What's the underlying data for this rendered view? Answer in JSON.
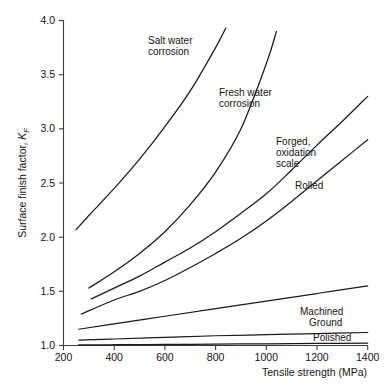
{
  "chart_data": {
    "type": "line",
    "title": "",
    "xlabel": "Tensile strength (MPa)",
    "ylabel": "Surface finish factor, K_F",
    "ylabel_main": "Surface finish factor, ",
    "ylabel_symbol": "K",
    "ylabel_subscript": "F",
    "xlim": [
      200,
      1400
    ],
    "ylim": [
      1.0,
      4.0
    ],
    "grid": false,
    "legend_position": "inline-annotations",
    "xticks": [
      200,
      400,
      600,
      800,
      1000,
      1200,
      1400
    ],
    "xtick_labels": [
      "200",
      "400",
      "600",
      "800",
      "1000",
      "1200",
      "1400"
    ],
    "yticks": [
      1.0,
      1.5,
      2.0,
      2.5,
      3.0,
      3.5,
      4.0
    ],
    "ytick_labels": [
      "1.0",
      "1.5",
      "2.0",
      "2.5",
      "3.0",
      "3.5",
      "4.0"
    ],
    "series": [
      {
        "name": "Salt water corrosion",
        "label": "Salt water\ncorrosion",
        "label_line1": "Salt water",
        "label_line2": "corrosion",
        "x": [
          250,
          300,
          400,
          500,
          600,
          700,
          800,
          840
        ],
        "values": [
          2.07,
          2.2,
          2.45,
          2.72,
          3.02,
          3.35,
          3.75,
          3.93
        ]
      },
      {
        "name": "Fresh water corrosion",
        "label": "Fresh water\ncorrosion",
        "label_line1": "Fresh water",
        "label_line2": "corrosion",
        "x": [
          300,
          400,
          500,
          600,
          700,
          800,
          900,
          1000,
          1040
        ],
        "values": [
          1.53,
          1.68,
          1.85,
          2.05,
          2.3,
          2.6,
          3.0,
          3.6,
          3.9
        ]
      },
      {
        "name": "Forged, oxidation scale",
        "label": "Forged,\noxidation\nscale",
        "label_line1": "Forged,",
        "label_line2": "oxidation",
        "label_line3": "scale",
        "x": [
          310,
          400,
          500,
          600,
          700,
          800,
          900,
          1000,
          1100,
          1200,
          1300,
          1400
        ],
        "values": [
          1.43,
          1.53,
          1.64,
          1.77,
          1.9,
          2.05,
          2.22,
          2.4,
          2.62,
          2.85,
          3.07,
          3.3
        ]
      },
      {
        "name": "Rolled",
        "label": "Rolled",
        "label_line1": "Rolled",
        "x": [
          270,
          400,
          500,
          600,
          700,
          800,
          900,
          1000,
          1100,
          1200,
          1300,
          1400
        ],
        "values": [
          1.29,
          1.42,
          1.5,
          1.6,
          1.72,
          1.85,
          1.99,
          2.15,
          2.33,
          2.52,
          2.71,
          2.9
        ]
      },
      {
        "name": "Machined",
        "label": "Machined",
        "label_line1": "Machined",
        "x": [
          260,
          400,
          600,
          800,
          1000,
          1200,
          1400
        ],
        "values": [
          1.15,
          1.2,
          1.27,
          1.34,
          1.41,
          1.48,
          1.55
        ]
      },
      {
        "name": "Ground",
        "label": "Ground",
        "label_line1": "Ground",
        "x": [
          260,
          400,
          600,
          800,
          1000,
          1200,
          1400
        ],
        "values": [
          1.05,
          1.06,
          1.075,
          1.09,
          1.1,
          1.11,
          1.12
        ]
      },
      {
        "name": "Polished",
        "label": "Polished",
        "label_line1": "Polished",
        "x": [
          260,
          400,
          600,
          800,
          1000,
          1200,
          1400
        ],
        "values": [
          1.005,
          1.007,
          1.01,
          1.013,
          1.016,
          1.019,
          1.022
        ]
      }
    ],
    "annotations": [
      {
        "text": "Salt water corrosion",
        "x_px": 148,
        "y_px": 44
      },
      {
        "text": "Fresh water corrosion",
        "x_px": 219,
        "y_px": 96
      },
      {
        "text": "Forged, oxidation scale",
        "x_px": 276,
        "y_px": 145
      },
      {
        "text": "Rolled",
        "x_px": 295,
        "y_px": 186
      },
      {
        "text": "Machined",
        "x_px": 300,
        "y_px": 312
      },
      {
        "text": "Ground",
        "x_px": 307,
        "y_px": 323
      },
      {
        "text": "Polished",
        "x_px": 313,
        "y_px": 339
      }
    ],
    "colors": {
      "curve": "#1a1a1a",
      "axis": "#3c3c3c",
      "background": "#ffffff",
      "text": "#141414"
    }
  }
}
